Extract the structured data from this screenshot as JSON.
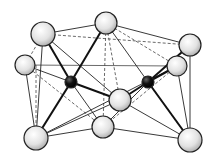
{
  "diagram": {
    "type": "molecular-cluster",
    "colors": {
      "light_atom": "#e6e6e6",
      "dark_atom": "#111111",
      "bond": "#222222",
      "background": "#ffffff"
    },
    "atoms": [
      {
        "id": "top-left",
        "x": 43,
        "y": 34,
        "r": 12,
        "kind": "light"
      },
      {
        "id": "top-center",
        "x": 106,
        "y": 23,
        "r": 11,
        "kind": "light"
      },
      {
        "id": "top-right",
        "x": 190,
        "y": 45,
        "r": 11,
        "kind": "light"
      },
      {
        "id": "left",
        "x": 25,
        "y": 65,
        "r": 10,
        "kind": "light"
      },
      {
        "id": "right",
        "x": 177,
        "y": 66,
        "r": 10,
        "kind": "light"
      },
      {
        "id": "center",
        "x": 120,
        "y": 100,
        "r": 11,
        "kind": "light"
      },
      {
        "id": "bottom-left",
        "x": 36,
        "y": 138,
        "r": 12,
        "kind": "light"
      },
      {
        "id": "bottom-center",
        "x": 103,
        "y": 127,
        "r": 11,
        "kind": "light"
      },
      {
        "id": "bottom-right",
        "x": 190,
        "y": 140,
        "r": 12,
        "kind": "light"
      },
      {
        "id": "metal-left",
        "x": 71,
        "y": 82,
        "r": 6,
        "kind": "dark"
      },
      {
        "id": "metal-right",
        "x": 148,
        "y": 82,
        "r": 6,
        "kind": "dark"
      }
    ]
  }
}
